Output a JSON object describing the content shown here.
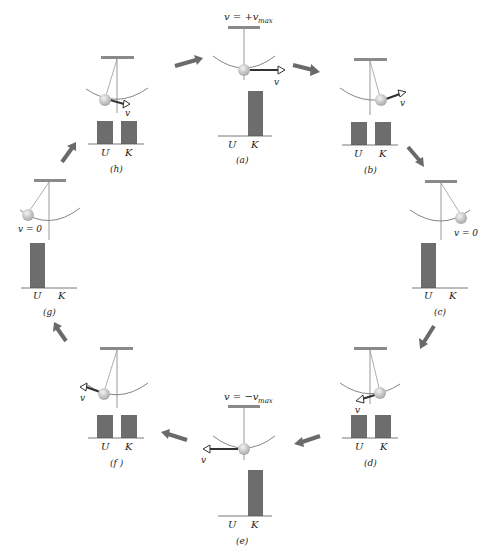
{
  "colors": {
    "bar": "#6d6d6d",
    "arrow": "#6a6a6a",
    "line": "#888888",
    "ceiling": "#8a8a8a",
    "bob": "#cfcfcf"
  },
  "axis_labels": {
    "U": "U",
    "K": "K"
  },
  "panels": [
    {
      "id": "a",
      "label": "(a)",
      "velocity_note": "v = +v_max",
      "vec": "v",
      "U": 0,
      "K": 1
    },
    {
      "id": "b",
      "label": "(b)",
      "velocity_note": "",
      "vec": "v",
      "U": 0.5,
      "K": 0.5
    },
    {
      "id": "c",
      "label": "(c)",
      "velocity_note": "v = 0",
      "vec": "v",
      "U": 1,
      "K": 0
    },
    {
      "id": "d",
      "label": "(d)",
      "velocity_note": "",
      "vec": "v",
      "U": 0.5,
      "K": 0.5
    },
    {
      "id": "e",
      "label": "(e)",
      "velocity_note": "v = −v_max",
      "vec": "v",
      "U": 0,
      "K": 1
    },
    {
      "id": "f",
      "label": "(f )",
      "velocity_note": "",
      "vec": "v",
      "U": 0.5,
      "K": 0.5
    },
    {
      "id": "g",
      "label": "(g)",
      "velocity_note": "v = 0",
      "vec": "v",
      "U": 1,
      "K": 0
    },
    {
      "id": "h",
      "label": "(h)",
      "velocity_note": "",
      "vec": "v",
      "U": 0.5,
      "K": 0.5
    }
  ],
  "text": {
    "a_top": "v = +v",
    "a_sub": "max",
    "e_top": "v = −v",
    "e_sub": "max",
    "c_v0": "v = 0",
    "g_v0": "v = 0",
    "vec_v": "v",
    "la": "(a)",
    "lb": "(b)",
    "lc": "(c)",
    "ld": "(d)",
    "le": "(e)",
    "lf": "(f )",
    "lg": "(g)",
    "lh": "(h)",
    "U": "U",
    "K": "K"
  }
}
